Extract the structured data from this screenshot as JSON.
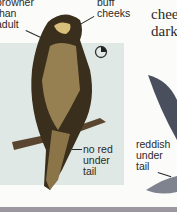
{
  "labels": {
    "browner": "browner\nthan\nadult",
    "buff_cheeks": "buff\ncheeks",
    "no_red": "no red\nunder\ntail",
    "reddish": "reddish\nunder\ntail"
  },
  "side_text": "chee\ndark",
  "icons": {
    "age_symbol": "juvenile-age-symbol"
  },
  "colors": {
    "panel": "#dfe8e4",
    "footer": "#9b98a2",
    "bird_dark": "#3a2e1c",
    "bird_buff": "#c9b27a",
    "wing_grey": "#4a4f5e"
  }
}
